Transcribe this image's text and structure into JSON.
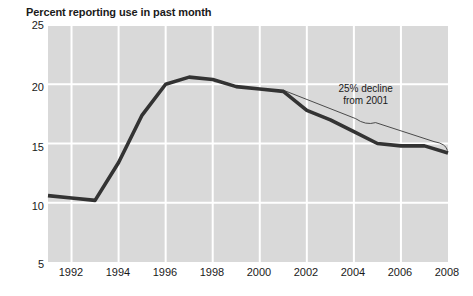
{
  "chart_data": {
    "type": "line",
    "title": "Percent reporting use in past month",
    "xlabel": "",
    "ylabel": "",
    "xlim": [
      1991,
      2008
    ],
    "ylim": [
      5,
      25
    ],
    "yticks": [
      25,
      20,
      15,
      10,
      5
    ],
    "xticks": [
      1992,
      1994,
      1996,
      1998,
      2000,
      2002,
      2004,
      2006,
      2008
    ],
    "grid": true,
    "legend": "none",
    "plot_background": "#d9d9d9",
    "gridline_color": "#ffffff",
    "line_color": "#333333",
    "x": [
      1991,
      1992,
      1993,
      1994,
      1995,
      1996,
      1997,
      1998,
      1999,
      2000,
      2001,
      2002,
      2003,
      2004,
      2005,
      2006,
      2007,
      2008
    ],
    "values": [
      10.6,
      10.4,
      10.2,
      13.4,
      17.4,
      20.0,
      20.6,
      20.4,
      19.8,
      19.6,
      19.4,
      17.8,
      17.0,
      16.0,
      15.0,
      14.8,
      14.8,
      14.2
    ],
    "series": [
      {
        "name": "Percent reporting use in past month",
        "values": [
          10.6,
          10.4,
          10.2,
          13.4,
          17.4,
          20.0,
          20.6,
          20.4,
          19.8,
          19.6,
          19.4,
          17.8,
          17.0,
          16.0,
          15.0,
          14.8,
          14.8,
          14.2
        ]
      }
    ],
    "annotations": [
      {
        "line1": "25% decline",
        "line2": "from 2001",
        "from_year": 2001,
        "from_value": 19.5,
        "to_year": 2008,
        "to_value": 14.4
      }
    ]
  },
  "yticks": {
    "t0": "25",
    "t1": "20",
    "t2": "15",
    "t3": "10",
    "t4": "5"
  },
  "xticks": {
    "t0": "1992",
    "t1": "1994",
    "t2": "1996",
    "t3": "1998",
    "t4": "2000",
    "t5": "2002",
    "t6": "2004",
    "t7": "2006",
    "t8": "2008"
  },
  "annotation": {
    "line1": "25% decline",
    "line2": "from 2001"
  }
}
